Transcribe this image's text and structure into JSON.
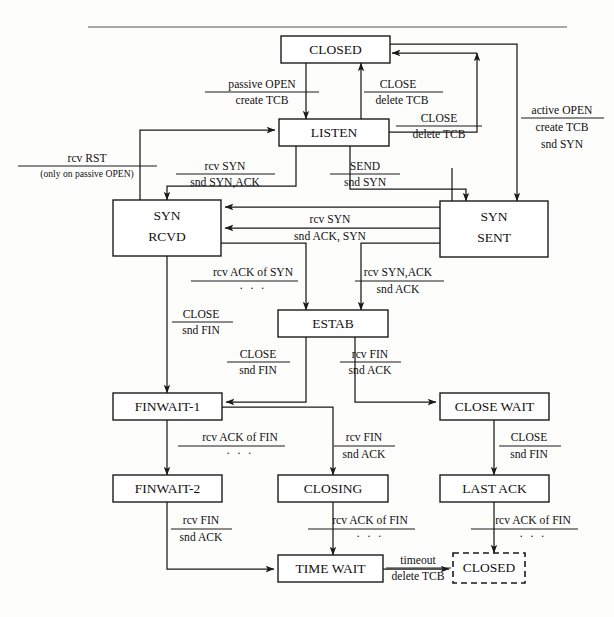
{
  "figure": {
    "kind": "tcp-state-transition-diagram",
    "top_rule": true
  },
  "states": [
    {
      "id": "closed",
      "label": "CLOSED",
      "x": 281,
      "y": 36,
      "w": 109,
      "h": 27,
      "style": "solid",
      "lines": [
        "CLOSED"
      ]
    },
    {
      "id": "listen",
      "label": "LISTEN",
      "x": 279,
      "y": 119,
      "w": 110,
      "h": 27,
      "style": "solid",
      "lines": [
        "LISTEN"
      ]
    },
    {
      "id": "syn_rcvd",
      "label": "SYN RCVD",
      "x": 113,
      "y": 200,
      "w": 108,
      "h": 56,
      "style": "solid",
      "lines": [
        "SYN",
        "RCVD"
      ]
    },
    {
      "id": "syn_sent",
      "label": "SYN SENT",
      "x": 440,
      "y": 201,
      "w": 108,
      "h": 56,
      "style": "solid",
      "lines": [
        "SYN",
        "SENT"
      ]
    },
    {
      "id": "estab",
      "label": "ESTAB",
      "x": 278,
      "y": 310,
      "w": 110,
      "h": 27,
      "style": "solid",
      "lines": [
        "ESTAB"
      ]
    },
    {
      "id": "finwait1",
      "label": "FINWAIT-1",
      "x": 113,
      "y": 393,
      "w": 109,
      "h": 27,
      "style": "solid",
      "lines": [
        "FINWAIT-1"
      ]
    },
    {
      "id": "closewait",
      "label": "CLOSE WAIT",
      "x": 440,
      "y": 393,
      "w": 109,
      "h": 27,
      "style": "solid",
      "lines": [
        "CLOSE WAIT"
      ]
    },
    {
      "id": "finwait2",
      "label": "FINWAIT-2",
      "x": 113,
      "y": 475,
      "w": 109,
      "h": 27,
      "style": "solid",
      "lines": [
        "FINWAIT-2"
      ]
    },
    {
      "id": "closing",
      "label": "CLOSING",
      "x": 278,
      "y": 475,
      "w": 110,
      "h": 27,
      "style": "solid",
      "lines": [
        "CLOSING"
      ]
    },
    {
      "id": "lastack",
      "label": "LAST ACK",
      "x": 440,
      "y": 475,
      "w": 109,
      "h": 27,
      "style": "solid",
      "lines": [
        "LAST ACK"
      ]
    },
    {
      "id": "timewait",
      "label": "TIME WAIT",
      "x": 278,
      "y": 555,
      "w": 105,
      "h": 27,
      "style": "solid",
      "lines": [
        "TIME WAIT"
      ]
    },
    {
      "id": "closed2",
      "label": "CLOSED",
      "x": 453,
      "y": 553,
      "w": 72,
      "h": 30,
      "style": "dashed",
      "lines": [
        "CLOSED"
      ]
    }
  ],
  "transitions": [
    {
      "id": "t-passive-open",
      "from": "closed",
      "to": "listen",
      "top": "passive OPEN",
      "bottom": "create TCB",
      "cx": 262,
      "cy": 88
    },
    {
      "id": "t-close-listen",
      "from": "listen",
      "to": "closed",
      "top": "CLOSE",
      "bottom": "delete TCB",
      "cx": 396,
      "cy": 88
    },
    {
      "id": "t-close-listen2",
      "from": "listen",
      "to": "closed",
      "top": "CLOSE",
      "bottom": "delete TCB",
      "cx": 437,
      "cy": 122
    },
    {
      "id": "t-active-open",
      "from": "closed",
      "to": "syn_sent",
      "top": "active OPEN",
      "bottom": "create TCB",
      "extra": "snd SYN",
      "cx": 562,
      "cy": 117
    },
    {
      "id": "t-rcv-rst",
      "from": "syn_rcvd",
      "to": "listen",
      "top": "rcv RST",
      "bottom": "(only on passive OPEN)",
      "cx": 87,
      "cy": 162,
      "small_bottom": true
    },
    {
      "id": "t-rcv-syn-listen",
      "from": "listen",
      "to": "syn_rcvd",
      "top": "rcv SYN",
      "bottom": "snd SYN,ACK",
      "cx": 225,
      "cy": 172
    },
    {
      "id": "t-send",
      "from": "listen",
      "to": "syn_sent",
      "top": "SEND",
      "bottom": "snd SYN",
      "cx": 363,
      "cy": 172
    },
    {
      "id": "t-sim-open",
      "from": "syn_sent",
      "to": "syn_rcvd",
      "top": "rcv SYN",
      "bottom": "snd ACK, SYN",
      "cx": 330,
      "cy": 223
    },
    {
      "id": "t-rcv-ack-syn",
      "from": "syn_rcvd",
      "to": "estab",
      "top": "rcv ACK of SYN",
      "bottom": "· · ·",
      "cx": 253,
      "cy": 278,
      "bottom_is_dots": true
    },
    {
      "id": "t-rcv-synack",
      "from": "syn_sent",
      "to": "estab",
      "top": "rcv SYN,ACK",
      "bottom": "snd ACK",
      "cx": 397,
      "cy": 278
    },
    {
      "id": "t-close-synrcvd",
      "from": "syn_rcvd",
      "to": "finwait1",
      "top": "CLOSE",
      "bottom": "snd FIN",
      "cx": 201,
      "cy": 320
    },
    {
      "id": "t-close-estab",
      "from": "estab",
      "to": "finwait1",
      "top": "CLOSE",
      "bottom": "snd FIN",
      "cx": 258,
      "cy": 360
    },
    {
      "id": "t-rcv-fin-estab",
      "from": "estab",
      "to": "closewait",
      "top": "rcv FIN",
      "bottom": "snd ACK",
      "cx": 368,
      "cy": 360
    },
    {
      "id": "t-ack-fin-fw1",
      "from": "finwait1",
      "to": "finwait2",
      "top": "rcv ACK of FIN",
      "bottom": "· · ·",
      "cx": 240,
      "cy": 442,
      "bottom_is_dots": true
    },
    {
      "id": "t-rcv-fin-fw1",
      "from": "finwait1",
      "to": "closing",
      "top": "rcv FIN",
      "bottom": "snd ACK",
      "cx": 362,
      "cy": 442
    },
    {
      "id": "t-close-cw",
      "from": "closewait",
      "to": "lastack",
      "top": "CLOSE",
      "bottom": "snd FIN",
      "cx": 527,
      "cy": 442
    },
    {
      "id": "t-rcv-fin-fw2",
      "from": "finwait2",
      "to": "timewait",
      "top": "rcv FIN",
      "bottom": "snd ACK",
      "cx": 200,
      "cy": 525
    },
    {
      "id": "t-ack-fin-closing",
      "from": "closing",
      "to": "timewait",
      "top": "rcv ACK of FIN",
      "bottom": "· · ·",
      "cx": 368,
      "cy": 525,
      "bottom_is_dots": true
    },
    {
      "id": "t-ack-fin-lastack",
      "from": "lastack",
      "to": "closed2",
      "top": "rcv ACK of FIN",
      "bottom": "· · ·",
      "cx": 531,
      "cy": 525,
      "bottom_is_dots": true
    },
    {
      "id": "t-timeout",
      "from": "timewait",
      "to": "closed2",
      "top": "timeout",
      "bottom": "delete TCB",
      "cx": 418,
      "cy": 558
    }
  ],
  "colors": {
    "ink": "#111111",
    "stroke": "#1a1a1a",
    "paper": "#fdfdfc",
    "rule": "#555555"
  }
}
